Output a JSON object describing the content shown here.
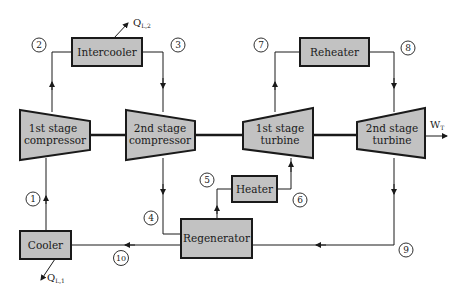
{
  "diagram": {
    "colors": {
      "component_fill": "#c2c2c2",
      "stroke": "#1a1a1a",
      "background": "#ffffff"
    },
    "components": {
      "intercooler": "Intercooler",
      "reheater": "Reheater",
      "compressor1_line1": "1st stage",
      "compressor1_line2": "compressor",
      "compressor2_line1": "2nd stage",
      "compressor2_line2": "compressor",
      "turbine1_line1": "1st stage",
      "turbine1_line2": "turbine",
      "turbine2_line1": "2nd stage",
      "turbine2_line2": "turbine",
      "heater": "Heater",
      "regenerator": "Regenerator",
      "cooler": "Cooler"
    },
    "states": [
      "1",
      "2",
      "3",
      "4",
      "5",
      "6",
      "7",
      "8",
      "9",
      "10"
    ],
    "heat_flows": {
      "intercooler_q": "Q",
      "intercooler_sub": "L,2",
      "cooler_q": "Q",
      "cooler_sub": "L,1"
    },
    "work": {
      "symbol": "W",
      "sub": "T"
    }
  }
}
